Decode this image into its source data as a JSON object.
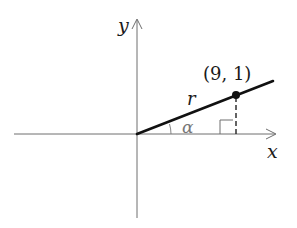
{
  "diagram": {
    "type": "coordinate-plane-angle",
    "axes": {
      "x_label": "x",
      "y_label": "y"
    },
    "point": {
      "label": "(9, 1)",
      "x": 9,
      "y": 1
    },
    "ray_label": "r",
    "angle_label": "α",
    "right_angle_marker": true,
    "colors": {
      "axes": "#6e6e6e",
      "ray": "#111111",
      "point": "#111111",
      "labels": "#1a1a1a",
      "angle_label": "#777777"
    }
  }
}
